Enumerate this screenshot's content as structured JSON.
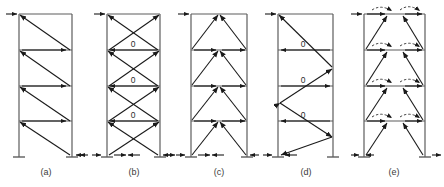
{
  "figure": {
    "type": "structural-frame-diagram",
    "panel_count": 5,
    "stories": 4,
    "colors": {
      "member": "#5d5d5d",
      "force": "#1a1a1a",
      "label": "#3a3a3a",
      "moment_arc": "#2b2b2b"
    }
  },
  "panels": [
    {
      "id": "a",
      "caption": "(a)",
      "bracing": "single-diagonal",
      "zero_labels": [],
      "load_arrow": "lateral-load-right"
    },
    {
      "id": "b",
      "caption": "(b)",
      "bracing": "x-bracing",
      "zero_labels": [
        "0",
        "0",
        "0"
      ],
      "load_arrow": "lateral-load-right"
    },
    {
      "id": "c",
      "caption": "(c)",
      "bracing": "chevron-inverted-v",
      "zero_labels": [],
      "load_arrow": "lateral-load-right"
    },
    {
      "id": "d",
      "caption": "(d)",
      "bracing": "zigzag-k",
      "zero_labels": [
        "0",
        "0",
        "0"
      ],
      "load_arrow": "lateral-load-right"
    },
    {
      "id": "e",
      "caption": "(e)",
      "bracing": "v-bracing-with-moments",
      "zero_labels": [],
      "load_arrow": "lateral-load-right"
    }
  ],
  "captions": {
    "a": "(a)",
    "b": "(b)",
    "c": "(c)",
    "d": "(d)",
    "e": "(e)"
  },
  "zeros": {
    "b1": "0",
    "b2": "0",
    "b3": "0",
    "d1": "0",
    "d2": "0",
    "d3": "0"
  }
}
